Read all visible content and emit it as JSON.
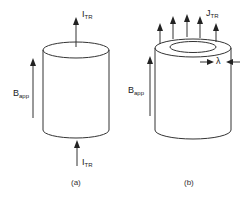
{
  "figure_a": {
    "caption": "(a)",
    "current_top_label": {
      "main": "I",
      "sub": "TR"
    },
    "current_bottom_label": {
      "main": "I",
      "sub": "TR"
    },
    "field_label": {
      "main": "B",
      "sub": "app"
    }
  },
  "figure_b": {
    "caption": "(b)",
    "current_density_label": {
      "main": "J",
      "sub": "TR"
    },
    "field_label": {
      "main": "B",
      "sub": "app"
    },
    "penetration_depth_label": "λ",
    "arrow_count": 5
  },
  "colors": {
    "line": "#333333",
    "background": "#ffffff"
  }
}
